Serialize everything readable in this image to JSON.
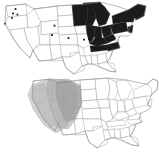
{
  "figure": {
    "type": "map-figure",
    "background_color": "#ffffff",
    "panel_count": 2,
    "width_px": 159,
    "height_px": 155
  },
  "colors": {
    "dark_fill": "#1b1b1b",
    "state_outline": "#9a9a9a",
    "country_outline": "#8c8c8c",
    "shade_light": "#b8b8b8",
    "shade_medium": "#a6a6a6",
    "shade_dark": "#949494",
    "point_marker": "#161616",
    "background": "#ffffff"
  },
  "panels": [
    {
      "id": "panel-top",
      "name": "top-map",
      "projection_region": "contiguous-united-states",
      "shading_style": "solid-black",
      "caption": "",
      "highlighted_regions": [
        "Minnesota",
        "Wisconsin",
        "Michigan",
        "Illinois",
        "Indiana",
        "Ohio",
        "Pennsylvania",
        "New York",
        "Vermont",
        "New Hampshire",
        "Maine",
        "Massachusetts",
        "Connecticut",
        "Rhode Island",
        "New Jersey",
        "West Virginia",
        "Kentucky",
        "Tennessee",
        "North Carolina"
      ],
      "unhighlighted_regions": [
        "Washington",
        "Oregon",
        "California",
        "Nevada",
        "Idaho",
        "Montana",
        "Wyoming",
        "Utah",
        "Arizona",
        "Colorado",
        "New Mexico",
        "North Dakota",
        "South Dakota",
        "Nebraska",
        "Kansas",
        "Oklahoma",
        "Texas",
        "Iowa",
        "Missouri",
        "Arkansas",
        "Louisiana",
        "Mississippi",
        "Alabama",
        "Georgia",
        "Florida",
        "South Carolina",
        "Virginia",
        "Maryland",
        "Delaware"
      ],
      "point_markers": [
        {
          "label": "pnw-1",
          "x": 15.5,
          "y": 9.0
        },
        {
          "label": "pnw-2",
          "x": 13.0,
          "y": 13.5
        },
        {
          "label": "pnw-3",
          "x": 17.5,
          "y": 14.5
        },
        {
          "label": "pnw-4",
          "x": 12.0,
          "y": 18.0
        },
        {
          "label": "pnw-5",
          "x": 5.0,
          "y": 23.5
        },
        {
          "label": "plains-1",
          "x": 54.5,
          "y": 25.5
        },
        {
          "label": "plains-2",
          "x": 52.0,
          "y": 35.0
        },
        {
          "label": "plains-3",
          "x": 68.5,
          "y": 38.0
        },
        {
          "label": "plains-4",
          "x": 84.0,
          "y": 39.5
        },
        {
          "label": "plains-5",
          "x": 89.0,
          "y": 39.0
        }
      ]
    },
    {
      "id": "panel-bottom",
      "name": "bottom-map",
      "projection_region": "contiguous-united-states",
      "shading_style": "translucent-gray-overlays",
      "caption": "",
      "highlighted_regions": [
        "Washington",
        "Oregon",
        "Idaho",
        "Montana",
        "Wyoming",
        "Nevada",
        "Utah",
        "California",
        "Colorado",
        "Arizona"
      ],
      "unhighlighted_regions": [
        "New Mexico",
        "Texas",
        "Oklahoma",
        "Kansas",
        "Nebraska",
        "South Dakota",
        "North Dakota",
        "Minnesota",
        "Iowa",
        "Missouri",
        "Arkansas",
        "Louisiana",
        "Mississippi",
        "Alabama",
        "Tennessee",
        "Kentucky",
        "Illinois",
        "Wisconsin",
        "Michigan",
        "Indiana",
        "Ohio",
        "West Virginia",
        "Virginia",
        "North Carolina",
        "South Carolina",
        "Georgia",
        "Florida",
        "Pennsylvania",
        "New York",
        "New England"
      ],
      "overlay_polygons": [
        {
          "name": "range-outer",
          "tone": "light"
        },
        {
          "name": "range-middle",
          "tone": "medium"
        },
        {
          "name": "range-core",
          "tone": "dark"
        }
      ]
    }
  ]
}
